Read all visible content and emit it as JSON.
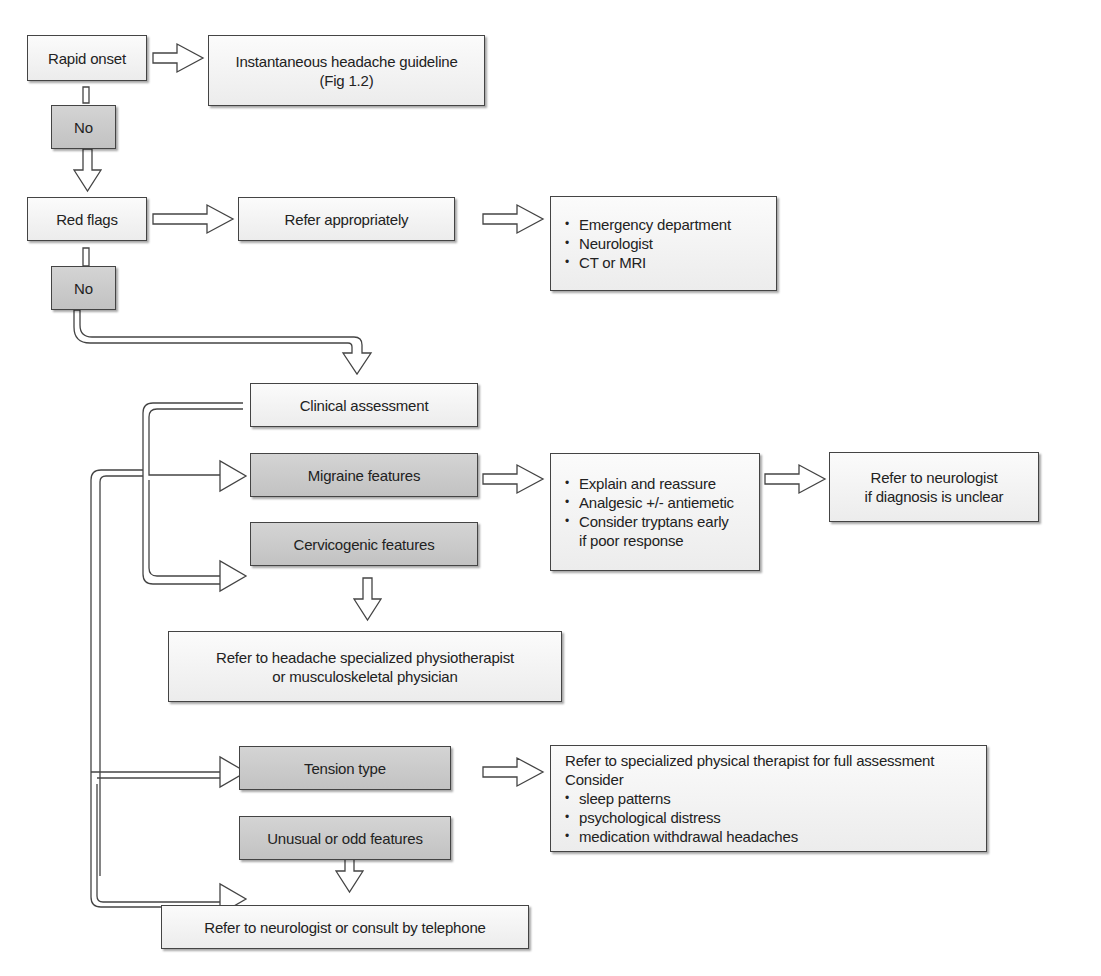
{
  "diagram": {
    "type": "flowchart",
    "colors": {
      "light_box": "#f0f0f0",
      "dark_box": "#c8c8c8",
      "border": "#444444"
    },
    "nodes": {
      "rapid_onset": "Rapid onset",
      "instantaneous": [
        "Instantaneous headache guideline",
        "(Fig 1.2)"
      ],
      "no_1": "No",
      "red_flags": "Red flags",
      "refer_appropriately": "Refer appropriately",
      "referral_options": [
        "Emergency department",
        "Neurologist",
        "CT or MRI"
      ],
      "no_2": "No",
      "clinical_assessment": "Clinical assessment",
      "migraine_features": "Migraine features",
      "migraine_management": [
        "Explain and reassure",
        "Analgesic +/- antiemetic",
        "Consider tryptans early",
        "if poor response"
      ],
      "refer_neurologist_unclear": [
        "Refer to neurologist",
        "if diagnosis is unclear"
      ],
      "cervicogenic_features": "Cervicogenic features",
      "refer_physio": [
        "Refer to headache specialized physiotherapist",
        "or musculoskeletal physician"
      ],
      "tension_type": "Tension type",
      "tension_management": {
        "line1": "Refer to specialized physical therapist for full assessment",
        "line2": "Consider",
        "items": [
          "sleep patterns",
          "psychological distress",
          "medication withdrawal headaches"
        ]
      },
      "unusual_features": "Unusual or odd features",
      "refer_neurologist_phone": "Refer to neurologist or consult by telephone"
    }
  }
}
